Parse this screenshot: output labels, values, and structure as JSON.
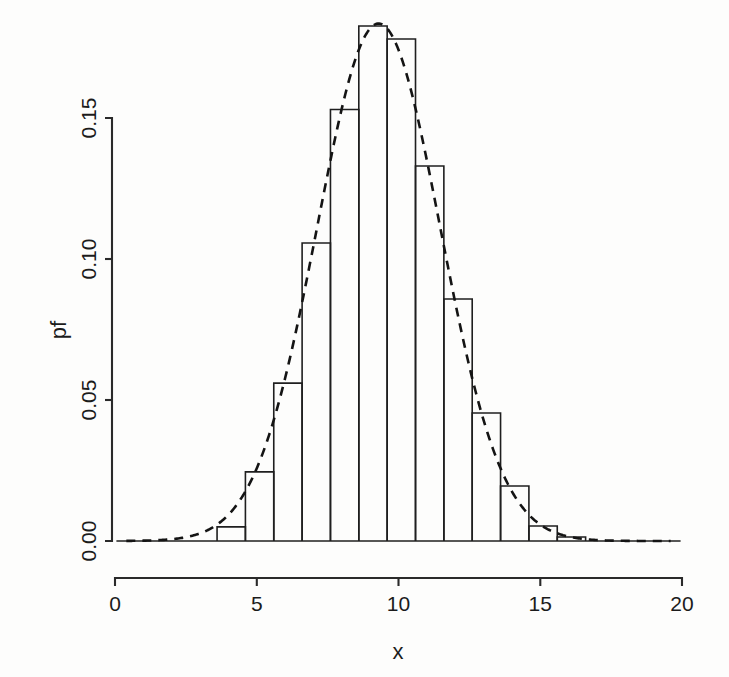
{
  "chart_data": {
    "type": "bar",
    "title": "",
    "subtitle": "",
    "xlabel": "x",
    "ylabel": "pf",
    "xlim": [
      0,
      20
    ],
    "ylim": [
      0.0,
      0.155
    ],
    "grid": false,
    "legend": null,
    "x_ticks": [
      0,
      5,
      10,
      15,
      20
    ],
    "x_tick_labels": [
      "0",
      "5",
      "10",
      "15",
      "20"
    ],
    "y_ticks": [
      0.0,
      0.05,
      0.1,
      0.15
    ],
    "y_tick_labels": [
      "0.00",
      "0.05",
      "0.10",
      "0.15"
    ],
    "bin_width": 1,
    "bin_edges": [
      3.6,
      4.6,
      5.6,
      6.6,
      7.6,
      8.6,
      9.6,
      10.6,
      11.6,
      12.6,
      13.6,
      14.6,
      15.6,
      16.6
    ],
    "categories": [
      "3.6-4.6",
      "4.6-5.6",
      "5.6-6.6",
      "6.6-7.6",
      "7.6-8.6",
      "8.6-9.6",
      "9.6-10.6",
      "10.6-11.6",
      "11.6-12.6",
      "12.6-13.6",
      "13.6-14.6",
      "14.6-15.6",
      "15.6-16.6"
    ],
    "values": [
      0.005,
      0.0245,
      0.056,
      0.1057,
      0.153,
      0.1826,
      0.178,
      0.133,
      0.0858,
      0.0454,
      0.0195,
      0.0053,
      0.0014
    ],
    "series": [
      {
        "name": "histogram",
        "kind": "bar",
        "values": [
          0.005,
          0.0245,
          0.056,
          0.1057,
          0.153,
          0.1826,
          0.178,
          0.133,
          0.0858,
          0.0454,
          0.0195,
          0.0053,
          0.0014
        ]
      },
      {
        "name": "density-curve",
        "kind": "line",
        "style": "dashed",
        "mean": 9.3,
        "sd": 2.17,
        "peak": 0.1835
      }
    ]
  },
  "axes": {
    "y_title": "pf",
    "x_title": "x",
    "x_tick_labels": [
      "0",
      "5",
      "10",
      "15",
      "20"
    ],
    "y_tick_labels": [
      "0.00",
      "0.05",
      "0.10",
      "0.15"
    ]
  },
  "colors": {
    "background": "#fdfdfc",
    "axis": "#2a2a2a",
    "bar_stroke": "#1f1f1f",
    "curve": "#141414"
  }
}
